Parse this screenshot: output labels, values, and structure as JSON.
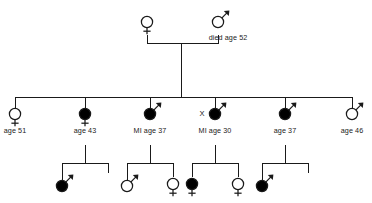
{
  "chart_data": {
    "type": "diagram",
    "diagram_type": "pedigree",
    "title": "",
    "generations": 3,
    "legend": {
      "filled": "affected",
      "open": "unaffected",
      "circle_with_arrow": "male",
      "circle_with_cross": "female"
    },
    "generation_1": {
      "label": "I",
      "individuals": [
        {
          "id": "I-1",
          "sex": "female",
          "symbol": "circle-with-cross",
          "affected": false,
          "label": "",
          "x": 147,
          "y": 22
        },
        {
          "id": "I-2",
          "sex": "male",
          "symbol": "circle-with-arrow",
          "affected": false,
          "label": "died age 52",
          "x": 218,
          "y": 22
        }
      ],
      "mating_line_y": 43,
      "descent_x": 181
    },
    "generation_2": {
      "label": "II",
      "sibship_bar_y": 97,
      "sibship_bar_x1": 15,
      "sibship_bar_x2": 352,
      "individuals": [
        {
          "id": "II-1",
          "sex": "female",
          "symbol": "circle-with-cross",
          "affected": false,
          "label": "age 51",
          "x": 15,
          "y": 114,
          "marker": ""
        },
        {
          "id": "II-2",
          "sex": "female",
          "symbol": "circle-with-cross",
          "affected": true,
          "label": "age 43",
          "x": 85,
          "y": 114,
          "marker": ""
        },
        {
          "id": "II-3",
          "sex": "male",
          "symbol": "circle-with-arrow",
          "affected": true,
          "label": "MI age 37",
          "x": 150,
          "y": 114,
          "marker": ""
        },
        {
          "id": "II-4",
          "sex": "male",
          "symbol": "circle-with-arrow",
          "affected": true,
          "label": "MI age 30",
          "x": 215,
          "y": 114,
          "marker": "X"
        },
        {
          "id": "II-5",
          "sex": "male",
          "symbol": "circle-with-arrow",
          "affected": true,
          "label": "age 37",
          "x": 285,
          "y": 114,
          "marker": ""
        },
        {
          "id": "II-6",
          "sex": "male",
          "symbol": "circle-with-arrow",
          "affected": false,
          "label": "age 46",
          "x": 352,
          "y": 114,
          "marker": ""
        }
      ]
    },
    "generation_3": {
      "label": "III",
      "sibships": [
        {
          "parent_id": "II-2",
          "parent_x": 85,
          "drop_top_y": 145,
          "bar_y": 163,
          "bar_x1": 62,
          "bar_x2": 108,
          "children": [
            {
              "id": "III-1",
              "sex": "male",
              "symbol": "circle-with-arrow",
              "affected": true,
              "label": "",
              "x": 62,
              "present": true
            },
            {
              "id": "III-2",
              "sex": "",
              "symbol": "none",
              "affected": false,
              "label": "",
              "x": 108,
              "present": false
            }
          ]
        },
        {
          "parent_id": "II-3",
          "parent_x": 150,
          "drop_top_y": 145,
          "bar_y": 163,
          "bar_x1": 127,
          "bar_x2": 173,
          "children": [
            {
              "id": "III-3",
              "sex": "male",
              "symbol": "circle-with-arrow",
              "affected": false,
              "label": "",
              "x": 127,
              "present": true
            },
            {
              "id": "III-4",
              "sex": "female",
              "symbol": "circle-with-cross",
              "affected": false,
              "label": "",
              "x": 173,
              "present": true
            }
          ]
        },
        {
          "parent_id": "II-4",
          "parent_x": 215,
          "drop_top_y": 145,
          "bar_y": 163,
          "bar_x1": 192,
          "bar_x2": 238,
          "children": [
            {
              "id": "III-5",
              "sex": "female",
              "symbol": "circle-with-cross",
              "affected": true,
              "label": "",
              "x": 192,
              "present": true
            },
            {
              "id": "III-6",
              "sex": "female",
              "symbol": "circle-with-cross",
              "affected": false,
              "label": "",
              "x": 238,
              "present": true
            }
          ]
        },
        {
          "parent_id": "II-5",
          "parent_x": 285,
          "drop_top_y": 145,
          "bar_y": 163,
          "bar_x1": 262,
          "bar_x2": 308,
          "children": [
            {
              "id": "III-7",
              "sex": "male",
              "symbol": "circle-with-arrow",
              "affected": true,
              "label": "",
              "x": 262,
              "present": true
            },
            {
              "id": "III-8",
              "sex": "",
              "symbol": "none",
              "affected": false,
              "label": "",
              "x": 308,
              "present": false
            }
          ]
        }
      ]
    },
    "annotations": [
      {
        "text": "died age 52",
        "near": "I-2"
      },
      {
        "text": "age 51",
        "near": "II-1"
      },
      {
        "text": "age 43",
        "near": "II-2"
      },
      {
        "text": "MI age 37",
        "near": "II-3"
      },
      {
        "text": "X",
        "near": "II-4"
      },
      {
        "text": "MI age 30",
        "near": "II-4"
      },
      {
        "text": "age 37",
        "near": "II-5"
      },
      {
        "text": "age 46",
        "near": "II-6"
      }
    ],
    "colors": {
      "stroke": "#1a1a1a",
      "fill_affected": "#000000",
      "fill_unaffected": "#ffffff",
      "background": "#ffffff"
    }
  }
}
